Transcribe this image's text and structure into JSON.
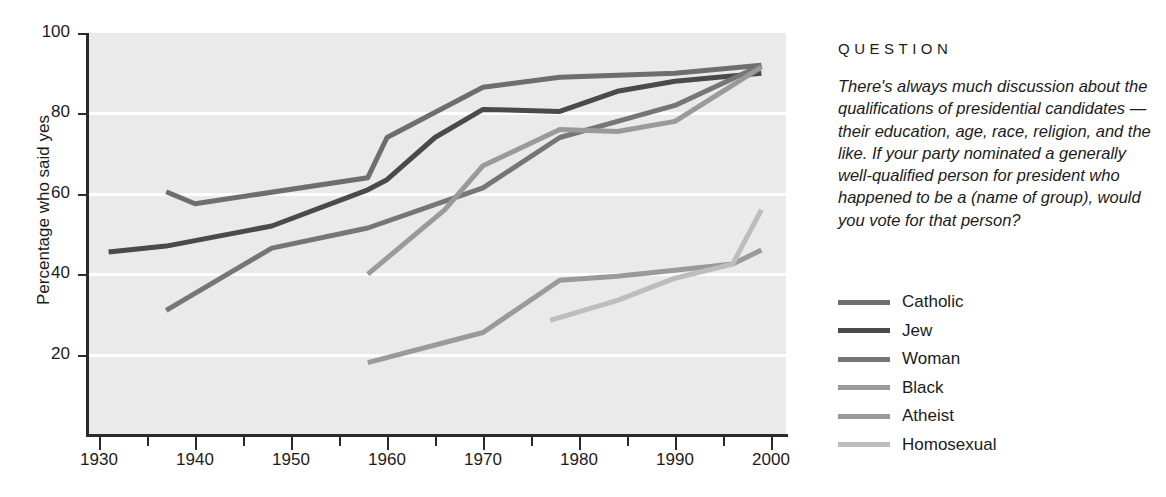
{
  "panel": {
    "question_heading": "QUESTION",
    "question_text": "There's always much discussion about the qualifications of presidential candidates — their education, age, race, religion, and the like. If your party nominated a generally well-qualified person for president who happened to be a (name of group), would you vote for that person?"
  },
  "chart_data": {
    "type": "line",
    "title": "",
    "xlabel": "",
    "ylabel": "Percentage who said yes",
    "xlim": [
      1930,
      2000
    ],
    "ylim": [
      0,
      100
    ],
    "yticks": [
      20,
      40,
      60,
      80,
      100
    ],
    "ytick_labels": [
      "20",
      "40",
      "60",
      "80",
      "100"
    ],
    "xticks": [
      1930,
      1940,
      1950,
      1960,
      1970,
      1980,
      1990,
      2000
    ],
    "xtick_labels": [
      "1930",
      "1940",
      "1950",
      "1960",
      "1970",
      "1980",
      "1990",
      "2000"
    ],
    "x_minor_ticks": [
      1935,
      1945,
      1955,
      1965,
      1975,
      1985,
      1995
    ],
    "grid": "horizontal-white",
    "legend_position": "right",
    "plot_background": "#eaeaea",
    "gridline_color": "#ffffff",
    "axis_color": "#2b2b2b",
    "series": [
      {
        "name": "Catholic",
        "color": "#6e6e6e",
        "x": [
          1937,
          1940,
          1958,
          1960,
          1970,
          1978,
          1984,
          1990,
          1999
        ],
        "values": [
          60.5,
          57.5,
          64.0,
          74.0,
          86.5,
          89.0,
          89.5,
          90.0,
          92.0
        ]
      },
      {
        "name": "Jew",
        "color": "#4a4a4a",
        "x": [
          1931,
          1937,
          1948,
          1958,
          1960,
          1965,
          1970,
          1978,
          1984,
          1990,
          1999
        ],
        "values": [
          45.5,
          47.0,
          52.0,
          61.0,
          63.5,
          74.0,
          81.0,
          80.5,
          85.5,
          88.0,
          90.0
        ]
      },
      {
        "name": "Woman",
        "color": "#767676",
        "x": [
          1937,
          1948,
          1958,
          1970,
          1978,
          1984,
          1990,
          1999
        ],
        "values": [
          31.0,
          46.5,
          51.5,
          61.5,
          74.0,
          78.0,
          82.0,
          92.0
        ]
      },
      {
        "name": "Black",
        "color": "#9a9a9a",
        "x": [
          1958,
          1966,
          1970,
          1978,
          1984,
          1990,
          1999
        ],
        "values": [
          40.0,
          56.0,
          67.0,
          76.0,
          75.5,
          78.0,
          91.5
        ]
      },
      {
        "name": "Atheist",
        "color": "#9a9a9a",
        "x": [
          1958,
          1970,
          1978,
          1984,
          1990,
          1996,
          1999
        ],
        "values": [
          18.0,
          25.5,
          38.5,
          39.5,
          41.0,
          42.5,
          46.0
        ]
      },
      {
        "name": "Homosexual",
        "color": "#bdbdbd",
        "x": [
          1977,
          1984,
          1990,
          1996,
          1999
        ],
        "values": [
          28.5,
          33.5,
          39.0,
          42.5,
          56.0
        ]
      }
    ]
  }
}
